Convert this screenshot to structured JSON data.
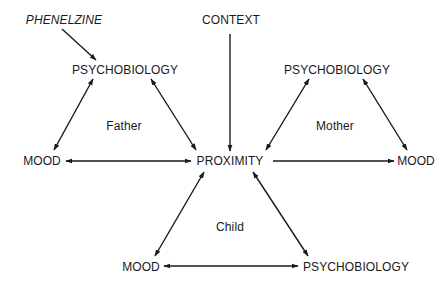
{
  "diagram": {
    "colors": {
      "ink": "#1a1a1a",
      "background": "#ffffff"
    },
    "nodes": {
      "phenelzine": {
        "label": "PHENELZINE",
        "x": 64,
        "y": 20,
        "style": "italic"
      },
      "context": {
        "label": "CONTEXT",
        "x": 231,
        "y": 20
      },
      "psychobiology_father": {
        "label": "PSYCHOBIOLOGY",
        "x": 125,
        "y": 70
      },
      "psychobiology_mother": {
        "label": "PSYCHOBIOLOGY",
        "x": 337,
        "y": 70
      },
      "mood_father": {
        "label": "MOOD",
        "x": 42,
        "y": 161
      },
      "proximity": {
        "label": "PROXIMITY",
        "x": 230,
        "y": 161
      },
      "mood_mother": {
        "label": "MOOD",
        "x": 416,
        "y": 161
      },
      "mood_child": {
        "label": "MOOD",
        "x": 141,
        "y": 267
      },
      "psychobiology_child": {
        "label": "PSYCHOBIOLOGY",
        "x": 356,
        "y": 267
      }
    },
    "group_labels": {
      "father": {
        "label": "Father",
        "x": 124,
        "y": 126
      },
      "mother": {
        "label": "Mother",
        "x": 335,
        "y": 126
      },
      "child": {
        "label": "Child",
        "x": 230,
        "y": 227
      }
    },
    "edges": [
      {
        "from": "phenelzine",
        "to": "psychobiology_father",
        "direction": "forward"
      },
      {
        "from": "context",
        "to": "proximity",
        "direction": "forward"
      },
      {
        "from": "psychobiology_father",
        "to": "mood_father",
        "direction": "both"
      },
      {
        "from": "psychobiology_father",
        "to": "proximity",
        "direction": "both"
      },
      {
        "from": "mood_father",
        "to": "proximity",
        "direction": "both"
      },
      {
        "from": "psychobiology_mother",
        "to": "proximity",
        "direction": "both"
      },
      {
        "from": "psychobiology_mother",
        "to": "mood_mother",
        "direction": "both"
      },
      {
        "from": "proximity",
        "to": "mood_mother",
        "direction": "forward"
      },
      {
        "from": "proximity",
        "to": "mood_child",
        "direction": "both"
      },
      {
        "from": "proximity",
        "to": "psychobiology_child",
        "direction": "both"
      },
      {
        "from": "mood_child",
        "to": "psychobiology_child",
        "direction": "both"
      }
    ]
  }
}
